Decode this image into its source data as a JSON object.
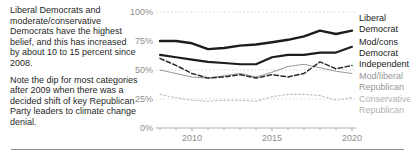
{
  "commentary": {
    "para1": "Liberal Democrats and moderate/conservative Democrats have the highest belief, and this has increased by about 10 to 15 percent since 2008.",
    "para2": "Note the dip for most categories after 2009 when there was a decided shift of key Republican Party leaders to climate change denial."
  },
  "chart_data": {
    "type": "line",
    "x": [
      2008,
      2009,
      2010,
      2011,
      2012,
      2013,
      2014,
      2015,
      2016,
      2017,
      2018,
      2019,
      2020
    ],
    "xlim": [
      2008,
      2020
    ],
    "ylim": [
      0,
      100
    ],
    "grid": "dotted horizontal lines at 100%, 50%, 25%; solid baseline at 0%",
    "grid_values": [
      100,
      50,
      25
    ],
    "y_axis_ticks": [
      {
        "value": 100,
        "label": "100%"
      },
      {
        "value": 75,
        "label": "75%"
      },
      {
        "value": 50,
        "label": "50%"
      },
      {
        "value": 25,
        "label": "25%"
      },
      {
        "value": 0,
        "label": "0%"
      }
    ],
    "x_axis_ticks": [
      {
        "value": 2010,
        "label": "2010"
      },
      {
        "value": 2015,
        "label": "2015"
      },
      {
        "value": 2020,
        "label": "2020"
      }
    ],
    "legend_position": "right",
    "series": [
      {
        "name": "Liberal Democrat",
        "variant": "solid-bold",
        "color": "#1c1c1c",
        "values": [
          75,
          75,
          73,
          68,
          69,
          71,
          72,
          74,
          76,
          79,
          84,
          81,
          84
        ]
      },
      {
        "name": "Mod/cons Democrat",
        "variant": "solid-medium",
        "color": "#1c1c1c",
        "values": [
          63,
          61,
          59,
          57,
          56,
          55,
          55,
          61,
          63,
          63,
          65,
          65,
          70
        ]
      },
      {
        "name": "Independent",
        "variant": "dashed",
        "color": "#2b2b2b",
        "values": [
          60,
          54,
          47,
          43,
          44,
          46,
          43,
          46,
          44,
          47,
          57,
          51,
          54
        ]
      },
      {
        "name": "Mod/liberal Republican",
        "variant": "solid-thin",
        "color": "#9c9c9c",
        "values": [
          50,
          47,
          44,
          43,
          45,
          47,
          44,
          48,
          53,
          55,
          52,
          49,
          47
        ]
      },
      {
        "name": "Conservative Republican",
        "variant": "dotted",
        "color": "#bfbfbf",
        "values": [
          29,
          26,
          24,
          23,
          24,
          24,
          23,
          27,
          29,
          29,
          28,
          24,
          26
        ]
      }
    ]
  },
  "colors": {
    "axis": "#b0b0b0",
    "grid": "#c9c9c9",
    "tick_label": "#8e8e8e",
    "body_text": "#1f1f1f",
    "legend_gray": "#979797",
    "legend_light_gray": "#b2b2b2",
    "divider": "#8f8f8f"
  }
}
